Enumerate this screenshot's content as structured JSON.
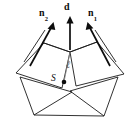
{
  "figure": {
    "kind": "geometry-diagram",
    "background_color": "#ffffff",
    "line_color": "#1a1a1a",
    "crease_color": "#8a8a8a",
    "vector_color": "#0d0d0d",
    "width": 130,
    "height": 122
  },
  "labels": {
    "normal_left": {
      "symbol": "n",
      "subscript": "2",
      "text": "n2"
    },
    "normal_right": {
      "symbol": "n",
      "subscript": "1",
      "text": "n1"
    },
    "direction": {
      "symbol": "d",
      "text": "d"
    },
    "edge": {
      "symbol": "ℓ",
      "text": "ℓ"
    },
    "point": {
      "symbol": "S",
      "text": "S"
    }
  },
  "vectors": [
    {
      "name": "n2",
      "origin": [
        30,
        66
      ],
      "tip": [
        53,
        24
      ]
    },
    {
      "name": "d",
      "origin": [
        70,
        50
      ],
      "tip": [
        70,
        18
      ]
    },
    {
      "name": "n1",
      "origin": [
        110,
        66
      ],
      "tip": [
        88,
        24
      ]
    }
  ],
  "points": [
    {
      "name": "S",
      "x": 64,
      "y": 82
    }
  ],
  "faces": [
    {
      "name": "left-upper-face",
      "vertices": [
        [
          18,
          72
        ],
        [
          42,
          42
        ],
        [
          70,
          50
        ],
        [
          60,
          84
        ]
      ]
    },
    {
      "name": "right-upper-face",
      "vertices": [
        [
          70,
          50
        ],
        [
          98,
          41
        ],
        [
          122,
          72
        ],
        [
          76,
          83
        ]
      ]
    },
    {
      "name": "left-lower-face",
      "vertices": [
        [
          22,
          78
        ],
        [
          62,
          88
        ],
        [
          30,
          114
        ]
      ]
    },
    {
      "name": "right-lower-face",
      "vertices": [
        [
          116,
          78
        ],
        [
          78,
          88
        ],
        [
          108,
          114
        ]
      ]
    }
  ]
}
